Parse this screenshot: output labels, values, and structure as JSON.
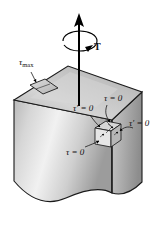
{
  "figure": {
    "background_color": "#ffffff",
    "width": 156,
    "height": 250,
    "ink_color": "#111111"
  },
  "colors": {
    "top_face_light": "#d8d8d8",
    "top_face_dark": "#a8a8a8",
    "front_face_light": "#eeeeee",
    "front_face_dark": "#9a9a9a",
    "right_face_light": "#c9c9c9",
    "right_face_dark": "#8f8f8f",
    "outline": "#1a1a1a",
    "element_fill": "#cfcfcf",
    "arrow": "#000000"
  },
  "labels": {
    "tau_max": {
      "symbol": "τ",
      "subscript": "max",
      "text": "τmax"
    },
    "torque": {
      "text": "T"
    },
    "tau_zero_top": {
      "text": "τ = 0"
    },
    "tau_prime_zero_left": {
      "text": "τ′ = 0"
    },
    "tau_prime_zero_right": {
      "text": "τ′ = 0"
    },
    "tau_zero_bottom": {
      "text": "τ = 0"
    }
  },
  "annotations": {
    "max_shear_element": "inclined parallelogram element on top face at 45 degrees",
    "stress_element": "small cubic stress element at front-right corner",
    "torque_arrow": "vertical double arrow with circular curved arrow indicating applied torque T",
    "broken_edge": "wavy torn bottom edge indicating the block continues"
  }
}
